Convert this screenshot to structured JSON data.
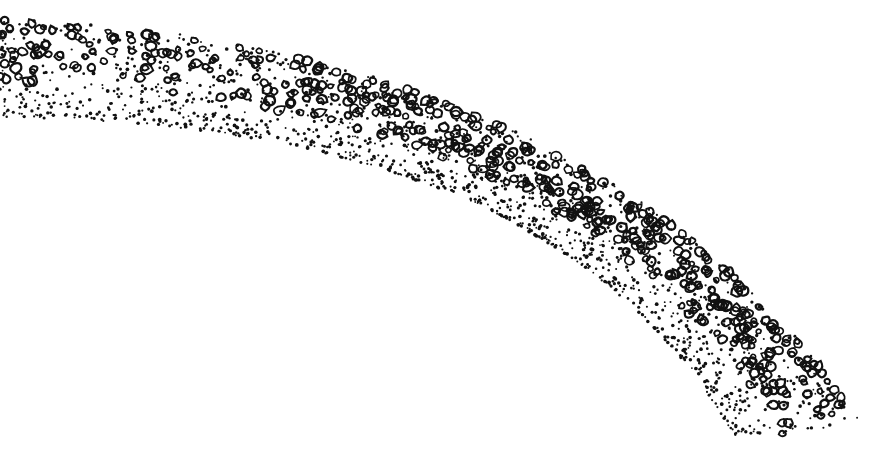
{
  "illustration": {
    "subject": "stippled curved band with pebble texture",
    "ink_color": "#111111",
    "background_color": "#ffffff",
    "outer_edge": {
      "start": [
        0,
        18
      ],
      "control": [
        600,
        40
      ],
      "end": [
        865,
        425
      ]
    },
    "inner_edge": {
      "start": [
        0,
        118
      ],
      "control": [
        560,
        120
      ],
      "end": [
        735,
        438
      ]
    },
    "pebble_fraction": 0.62,
    "seed": 7
  }
}
